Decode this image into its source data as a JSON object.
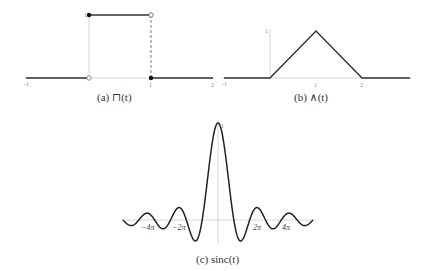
{
  "chart_data": [
    {
      "type": "line",
      "title": "(a) ⊓(t)",
      "function": "rect",
      "xlabel": "",
      "ylabel": "",
      "xlim": [
        -1,
        2
      ],
      "ylim": [
        0,
        1
      ],
      "x_ticks": [
        "-1",
        "1",
        "2"
      ],
      "y_ticks": [
        "1"
      ],
      "segments": [
        {
          "x": [
            -1,
            0
          ],
          "y": [
            0,
            0
          ]
        },
        {
          "x": [
            0,
            1
          ],
          "y": [
            1,
            1
          ]
        },
        {
          "x": [
            1,
            2
          ],
          "y": [
            0,
            0
          ]
        }
      ],
      "points": [
        {
          "x": 0,
          "y": 1,
          "filled": true
        },
        {
          "x": 0,
          "y": 0,
          "filled": false
        },
        {
          "x": 1,
          "y": 1,
          "filled": false
        },
        {
          "x": 1,
          "y": 0,
          "filled": true
        }
      ],
      "grid": false
    },
    {
      "type": "line",
      "title": "(b) ∧(t)",
      "function": "triangle",
      "xlabel": "",
      "ylabel": "",
      "xlim": [
        -1,
        3
      ],
      "ylim": [
        0,
        1
      ],
      "x_ticks": [
        "-1",
        "1",
        "2"
      ],
      "y_ticks": [
        "1"
      ],
      "x": [
        -1,
        0,
        1,
        2,
        3
      ],
      "y": [
        0,
        0,
        1,
        0,
        0
      ],
      "grid": false
    },
    {
      "type": "line",
      "title": "(c) sinc(t)",
      "function": "sin(t)/t",
      "xlabel": "",
      "ylabel": "",
      "xlim": [
        -18.85,
        18.85
      ],
      "ylim": [
        -0.22,
        1
      ],
      "x_ticks": [
        "−4π",
        "−2π",
        "2π",
        "4π"
      ],
      "y_ticks": [
        "1"
      ],
      "peak": {
        "x": 0,
        "y": 1
      },
      "zeros": [
        "±π",
        "±2π",
        "±3π",
        "±4π",
        "±5π"
      ],
      "grid": false
    }
  ],
  "captions": {
    "a": "(a) ⊓(t)",
    "b": "(b) ∧(t)",
    "c": "(c) sinc(t)"
  },
  "labels": {
    "a_xm1": "-1",
    "a_x1": "1",
    "a_x2": "2",
    "a_y1": "1",
    "b_xm1": "-1",
    "b_x1": "1",
    "b_x2": "2",
    "b_y1": "1",
    "c_y1": "1",
    "c_m4": "−4π",
    "c_m2": "−2π",
    "c_p2": "2π",
    "c_p4": "4π"
  }
}
